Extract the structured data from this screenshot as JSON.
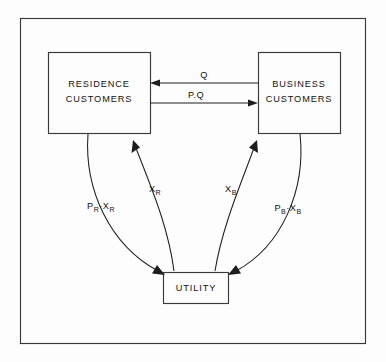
{
  "diagram": {
    "background_color": "#fdfdfd",
    "line_color": "#1d1d1d",
    "frame_color": "#3a3a3a",
    "frame": {
      "x": 20,
      "y": 18,
      "width": 345,
      "height": 325
    },
    "nodes": [
      {
        "id": "residence",
        "line1": "RESIDENCE",
        "line2": "CUSTOMERS",
        "x": 48,
        "y": 52,
        "width": 102,
        "height": 81
      },
      {
        "id": "business",
        "line1": "BUSINESS",
        "line2": "CUSTOMERS",
        "x": 258,
        "y": 52,
        "width": 82,
        "height": 81
      },
      {
        "id": "utility",
        "line1": "UTILITY",
        "line2": "",
        "x": 163,
        "y": 272,
        "width": 65,
        "height": 31
      }
    ],
    "edges": [
      {
        "id": "q-business-to-residence",
        "label": "Q",
        "label_sub": "",
        "from": "business",
        "to": "residence",
        "direction": "left",
        "shape": "straight",
        "label_x": 204,
        "label_y": 79
      },
      {
        "id": "pq-residence-to-business",
        "label": "P.Q",
        "label_sub": "",
        "from": "residence",
        "to": "business",
        "direction": "right",
        "shape": "straight",
        "label_x": 196,
        "label_y": 99
      },
      {
        "id": "pr-xr-residence-to-utility",
        "label": "P",
        "label_sub": "R",
        "label2": "X",
        "label2_sub": "R",
        "separator": "·",
        "from": "residence",
        "to": "utility",
        "direction": "down",
        "shape": "curve",
        "label_x": 101,
        "label_y": 205
      },
      {
        "id": "xr-utility-to-residence",
        "label": "X",
        "label_sub": "R",
        "label2": "",
        "label2_sub": "",
        "separator": "",
        "from": "utility",
        "to": "residence",
        "direction": "up",
        "shape": "curve",
        "label_x": 155,
        "label_y": 190
      },
      {
        "id": "xb-utility-to-business",
        "label": "X",
        "label_sub": "B",
        "label2": "",
        "label2_sub": "",
        "separator": "",
        "from": "utility",
        "to": "business",
        "direction": "up",
        "shape": "curve",
        "label_x": 231,
        "label_y": 190
      },
      {
        "id": "pb-xb-business-to-utility",
        "label": "P",
        "label_sub": "B",
        "label2": "X",
        "label2_sub": "B",
        "separator": "·",
        "from": "business",
        "to": "utility",
        "direction": "down",
        "shape": "curve",
        "label_x": 288,
        "label_y": 208
      }
    ]
  }
}
